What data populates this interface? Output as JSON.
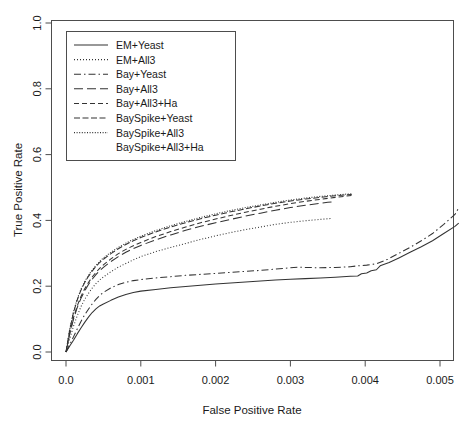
{
  "chart_data": {
    "type": "line",
    "title": "",
    "xlabel": "False Positive Rate",
    "ylabel": "True Positive Rate",
    "xlim": [
      0.0,
      0.00545
    ],
    "ylim": [
      0.0,
      1.0
    ],
    "xticks": [
      0.0,
      0.001,
      0.002,
      0.003,
      0.004,
      0.005
    ],
    "xtick_labels": [
      "0.0",
      "0.001",
      "0.002",
      "0.003",
      "0.004",
      "0.005"
    ],
    "yticks": [
      0.0,
      0.2,
      0.4,
      0.6,
      0.8,
      1.0
    ],
    "ytick_labels": [
      "0.0",
      "0.2",
      "0.4",
      "0.6",
      "0.8",
      "1.0"
    ],
    "grid": false,
    "legend_position": "top-left",
    "series": [
      {
        "name": "EM+Yeast",
        "dash": "none",
        "points": [
          [
            0.0,
            0.0
          ],
          [
            5e-05,
            0.018
          ],
          [
            0.0001,
            0.036
          ],
          [
            0.00015,
            0.055
          ],
          [
            0.0002,
            0.073
          ],
          [
            0.00025,
            0.09
          ],
          [
            0.0003,
            0.106
          ],
          [
            0.00035,
            0.12
          ],
          [
            0.0004,
            0.131
          ],
          [
            0.00045,
            0.14
          ],
          [
            0.0005,
            0.146
          ],
          [
            0.0006,
            0.157
          ],
          [
            0.0007,
            0.167
          ],
          [
            0.0008,
            0.175
          ],
          [
            0.0009,
            0.181
          ],
          [
            0.001,
            0.185
          ],
          [
            0.0012,
            0.19
          ],
          [
            0.0014,
            0.195
          ],
          [
            0.0016,
            0.199
          ],
          [
            0.0018,
            0.203
          ],
          [
            0.002,
            0.207
          ],
          [
            0.0022,
            0.21
          ],
          [
            0.0024,
            0.213
          ],
          [
            0.0026,
            0.216
          ],
          [
            0.0028,
            0.219
          ],
          [
            0.003,
            0.221
          ],
          [
            0.0032,
            0.223
          ],
          [
            0.0034,
            0.225
          ],
          [
            0.0036,
            0.227
          ],
          [
            0.0038,
            0.23
          ],
          [
            0.0039,
            0.231
          ],
          [
            0.00395,
            0.238
          ],
          [
            0.00402,
            0.24
          ],
          [
            0.00408,
            0.247
          ],
          [
            0.00415,
            0.25
          ],
          [
            0.0042,
            0.262
          ],
          [
            0.00432,
            0.272
          ],
          [
            0.00445,
            0.286
          ],
          [
            0.0046,
            0.303
          ],
          [
            0.00475,
            0.32
          ],
          [
            0.0049,
            0.338
          ],
          [
            0.00505,
            0.36
          ],
          [
            0.0052,
            0.382
          ],
          [
            0.00525,
            0.392
          ]
        ]
      },
      {
        "name": "EM+All3",
        "dash": "dotted",
        "points": [
          [
            0.0,
            0.0
          ],
          [
            5e-05,
            0.04
          ],
          [
            0.0001,
            0.078
          ],
          [
            0.00015,
            0.11
          ],
          [
            0.0002,
            0.138
          ],
          [
            0.00025,
            0.16
          ],
          [
            0.0003,
            0.178
          ],
          [
            0.00035,
            0.194
          ],
          [
            0.0004,
            0.208
          ],
          [
            0.00045,
            0.219
          ],
          [
            0.0005,
            0.228
          ],
          [
            0.0006,
            0.244
          ],
          [
            0.0007,
            0.258
          ],
          [
            0.0008,
            0.269
          ],
          [
            0.0009,
            0.28
          ],
          [
            0.001,
            0.29
          ],
          [
            0.0012,
            0.305
          ],
          [
            0.0014,
            0.318
          ],
          [
            0.0016,
            0.33
          ],
          [
            0.0018,
            0.342
          ],
          [
            0.002,
            0.353
          ],
          [
            0.0022,
            0.363
          ],
          [
            0.0024,
            0.372
          ],
          [
            0.0026,
            0.38
          ],
          [
            0.0028,
            0.388
          ],
          [
            0.003,
            0.394
          ],
          [
            0.0032,
            0.399
          ],
          [
            0.0034,
            0.403
          ],
          [
            0.0035,
            0.405
          ],
          [
            0.00355,
            0.406
          ]
        ]
      },
      {
        "name": "Bay+Yeast",
        "dash": "dashdot",
        "points": [
          [
            0.0,
            0.0
          ],
          [
            5e-05,
            0.022
          ],
          [
            0.0001,
            0.046
          ],
          [
            0.00015,
            0.07
          ],
          [
            0.0002,
            0.093
          ],
          [
            0.00025,
            0.113
          ],
          [
            0.0003,
            0.13
          ],
          [
            0.00035,
            0.146
          ],
          [
            0.0004,
            0.16
          ],
          [
            0.00045,
            0.172
          ],
          [
            0.0005,
            0.181
          ],
          [
            0.0006,
            0.195
          ],
          [
            0.0007,
            0.205
          ],
          [
            0.0008,
            0.212
          ],
          [
            0.0009,
            0.217
          ],
          [
            0.001,
            0.22
          ],
          [
            0.0012,
            0.225
          ],
          [
            0.0014,
            0.229
          ],
          [
            0.0016,
            0.233
          ],
          [
            0.0018,
            0.236
          ],
          [
            0.002,
            0.239
          ],
          [
            0.0022,
            0.242
          ],
          [
            0.0024,
            0.245
          ],
          [
            0.0026,
            0.248
          ],
          [
            0.0028,
            0.252
          ],
          [
            0.003,
            0.256
          ],
          [
            0.0031,
            0.258
          ],
          [
            0.0032,
            0.257
          ],
          [
            0.0034,
            0.256
          ],
          [
            0.0036,
            0.257
          ],
          [
            0.0038,
            0.259
          ],
          [
            0.0039,
            0.262
          ],
          [
            0.00402,
            0.264
          ],
          [
            0.00415,
            0.268
          ],
          [
            0.0043,
            0.282
          ],
          [
            0.00445,
            0.3
          ],
          [
            0.0046,
            0.318
          ],
          [
            0.00475,
            0.338
          ],
          [
            0.0049,
            0.36
          ],
          [
            0.00505,
            0.388
          ],
          [
            0.0052,
            0.418
          ],
          [
            0.00525,
            0.438
          ]
        ]
      },
      {
        "name": "Bay+All3",
        "dash": "longdash",
        "points": [
          [
            0.0,
            0.0
          ],
          [
            5e-05,
            0.055
          ],
          [
            0.0001,
            0.1
          ],
          [
            0.00015,
            0.135
          ],
          [
            0.0002,
            0.163
          ],
          [
            0.00025,
            0.186
          ],
          [
            0.0003,
            0.205
          ],
          [
            0.00035,
            0.221
          ],
          [
            0.0004,
            0.235
          ],
          [
            0.00045,
            0.247
          ],
          [
            0.0005,
            0.257
          ],
          [
            0.0006,
            0.275
          ],
          [
            0.0007,
            0.29
          ],
          [
            0.0008,
            0.303
          ],
          [
            0.0009,
            0.314
          ],
          [
            0.001,
            0.324
          ],
          [
            0.0012,
            0.341
          ],
          [
            0.0014,
            0.356
          ],
          [
            0.0016,
            0.37
          ],
          [
            0.0018,
            0.382
          ],
          [
            0.002,
            0.393
          ],
          [
            0.0022,
            0.403
          ],
          [
            0.0024,
            0.413
          ],
          [
            0.0026,
            0.422
          ],
          [
            0.0028,
            0.431
          ],
          [
            0.003,
            0.439
          ],
          [
            0.0032,
            0.446
          ],
          [
            0.0034,
            0.452
          ],
          [
            0.0035,
            0.455
          ],
          [
            0.00358,
            0.457
          ]
        ]
      },
      {
        "name": "Bay+All3+Ha",
        "dash": "dash",
        "points": [
          [
            0.0,
            0.0
          ],
          [
            5e-05,
            0.058
          ],
          [
            0.0001,
            0.104
          ],
          [
            0.00015,
            0.14
          ],
          [
            0.0002,
            0.169
          ],
          [
            0.00025,
            0.192
          ],
          [
            0.0003,
            0.211
          ],
          [
            0.00035,
            0.228
          ],
          [
            0.0004,
            0.242
          ],
          [
            0.00045,
            0.254
          ],
          [
            0.0005,
            0.265
          ],
          [
            0.0006,
            0.283
          ],
          [
            0.0007,
            0.299
          ],
          [
            0.0008,
            0.312
          ],
          [
            0.0009,
            0.323
          ],
          [
            0.001,
            0.333
          ],
          [
            0.0012,
            0.351
          ],
          [
            0.0014,
            0.366
          ],
          [
            0.0016,
            0.38
          ],
          [
            0.0018,
            0.393
          ],
          [
            0.002,
            0.404
          ],
          [
            0.0022,
            0.415
          ],
          [
            0.0024,
            0.425
          ],
          [
            0.0026,
            0.434
          ],
          [
            0.0028,
            0.443
          ],
          [
            0.003,
            0.451
          ],
          [
            0.0032,
            0.458
          ],
          [
            0.0034,
            0.464
          ],
          [
            0.0036,
            0.47
          ],
          [
            0.00375,
            0.474
          ],
          [
            0.00382,
            0.476
          ]
        ]
      },
      {
        "name": "BaySpike+Yeast",
        "dash": "dashdash",
        "points": [
          [
            0.0,
            0.0
          ],
          [
            5e-05,
            0.068
          ],
          [
            0.0001,
            0.12
          ],
          [
            0.00015,
            0.158
          ],
          [
            0.0002,
            0.188
          ],
          [
            0.00025,
            0.211
          ],
          [
            0.0003,
            0.23
          ],
          [
            0.00035,
            0.246
          ],
          [
            0.0004,
            0.26
          ],
          [
            0.00045,
            0.272
          ],
          [
            0.0005,
            0.282
          ],
          [
            0.0006,
            0.299
          ],
          [
            0.0007,
            0.314
          ],
          [
            0.0008,
            0.327
          ],
          [
            0.0009,
            0.338
          ],
          [
            0.001,
            0.348
          ],
          [
            0.0012,
            0.365
          ],
          [
            0.0014,
            0.38
          ],
          [
            0.0016,
            0.393
          ],
          [
            0.0018,
            0.405
          ],
          [
            0.002,
            0.416
          ],
          [
            0.0022,
            0.426
          ],
          [
            0.0024,
            0.435
          ],
          [
            0.0026,
            0.444
          ],
          [
            0.0028,
            0.452
          ],
          [
            0.003,
            0.459
          ],
          [
            0.0032,
            0.465
          ],
          [
            0.0034,
            0.47
          ],
          [
            0.0036,
            0.475
          ],
          [
            0.00375,
            0.478
          ],
          [
            0.00382,
            0.479
          ]
        ]
      },
      {
        "name": "BaySpike+All3",
        "dash": "finedot",
        "points": [
          [
            0.0,
            0.0
          ],
          [
            5e-05,
            0.07
          ],
          [
            0.0001,
            0.122
          ],
          [
            0.00015,
            0.161
          ],
          [
            0.0002,
            0.191
          ],
          [
            0.00025,
            0.214
          ],
          [
            0.0003,
            0.233
          ],
          [
            0.00035,
            0.249
          ],
          [
            0.0004,
            0.263
          ],
          [
            0.00045,
            0.275
          ],
          [
            0.0005,
            0.286
          ],
          [
            0.0006,
            0.303
          ],
          [
            0.0007,
            0.318
          ],
          [
            0.0008,
            0.331
          ],
          [
            0.0009,
            0.342
          ],
          [
            0.001,
            0.352
          ],
          [
            0.0012,
            0.369
          ],
          [
            0.0014,
            0.384
          ],
          [
            0.0016,
            0.397
          ],
          [
            0.0018,
            0.409
          ],
          [
            0.002,
            0.42
          ],
          [
            0.0022,
            0.43
          ],
          [
            0.0024,
            0.439
          ],
          [
            0.0026,
            0.447
          ],
          [
            0.0028,
            0.455
          ],
          [
            0.003,
            0.462
          ],
          [
            0.0032,
            0.468
          ],
          [
            0.0034,
            0.473
          ],
          [
            0.0036,
            0.477
          ],
          [
            0.00375,
            0.48
          ],
          [
            0.00382,
            0.481
          ]
        ]
      },
      {
        "name": "BaySpike+All3+Ha",
        "dash": "blank",
        "points": []
      }
    ]
  },
  "legend": {
    "entries": [
      {
        "label": "EM+Yeast"
      },
      {
        "label": "EM+All3"
      },
      {
        "label": "Bay+Yeast"
      },
      {
        "label": "Bay+All3"
      },
      {
        "label": "Bay+All3+Ha"
      },
      {
        "label": "BaySpike+Yeast"
      },
      {
        "label": "BaySpike+All3"
      },
      {
        "label": "BaySpike+All3+Ha"
      }
    ]
  },
  "colors": {
    "axis": "#4d4d4d",
    "curve": "#333333",
    "text": "#1a1a1a",
    "background": "#ffffff"
  }
}
